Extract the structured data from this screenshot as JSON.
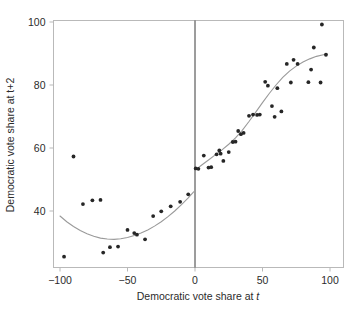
{
  "chart_data": {
    "type": "scatter",
    "title": "",
    "xlabel": "Democratic vote share at t",
    "xlabel_plain": "Democratic vote share at ",
    "xlabel_italic": "t",
    "ylabel": "Democratic vote share at t+2",
    "xlim": [
      -110,
      110
    ],
    "ylim": [
      22,
      103
    ],
    "xticks": [
      -100,
      -50,
      0,
      50,
      100
    ],
    "xtick_labels": [
      "-100",
      "-50",
      "0",
      "50",
      "100"
    ],
    "yticks": [
      40,
      60,
      80,
      100
    ],
    "ytick_labels": [
      "40",
      "60",
      "80",
      "100"
    ],
    "grid": false,
    "legend": "none",
    "cutoff": 0,
    "point_color": "#262626",
    "curve_color": "#9a9a9a",
    "axis_color": "#b9b9b9",
    "cutoff_color": "#3a3a3a",
    "series": [
      {
        "name": "Districts left of cutoff",
        "points": [
          [
            -97,
            25.5
          ],
          [
            -90,
            57.3
          ],
          [
            -83,
            42.2
          ],
          [
            -76,
            43.4
          ],
          [
            -70,
            43.5
          ],
          [
            -68,
            26.8
          ],
          [
            -63,
            28.5
          ],
          [
            -57,
            28.7
          ],
          [
            -50,
            34.0
          ],
          [
            -45,
            33.0
          ],
          [
            -43,
            32.5
          ],
          [
            -37,
            31.0
          ],
          [
            -31,
            38.4
          ],
          [
            -25,
            39.9
          ],
          [
            -18,
            41.5
          ],
          [
            -11,
            42.9
          ],
          [
            -5,
            45.3
          ]
        ]
      },
      {
        "name": "Districts right of cutoff",
        "points": [
          [
            0.5,
            53.5
          ],
          [
            2.5,
            53.4
          ],
          [
            6.5,
            57.6
          ],
          [
            10,
            53.8
          ],
          [
            12,
            53.9
          ],
          [
            16,
            58.0
          ],
          [
            18,
            59.2
          ],
          [
            19,
            58.2
          ],
          [
            21,
            55.9
          ],
          [
            25,
            58.7
          ],
          [
            28,
            61.9
          ],
          [
            30,
            62.0
          ],
          [
            32,
            65.4
          ],
          [
            34,
            64.4
          ],
          [
            36,
            64.8
          ],
          [
            40,
            70.2
          ],
          [
            43,
            70.6
          ],
          [
            46,
            70.5
          ],
          [
            48,
            70.6
          ],
          [
            52,
            81.0
          ],
          [
            54,
            79.8
          ],
          [
            57,
            73.3
          ],
          [
            59,
            69.9
          ],
          [
            61,
            79.0
          ],
          [
            64,
            71.6
          ],
          [
            68,
            86.7
          ],
          [
            71,
            80.8
          ],
          [
            73,
            88.0
          ],
          [
            76,
            86.7
          ],
          [
            84,
            80.9
          ],
          [
            86,
            84.9
          ],
          [
            88,
            91.9
          ],
          [
            93,
            80.8
          ],
          [
            94,
            99.2
          ],
          [
            97,
            89.6
          ]
        ]
      }
    ],
    "fit_left": {
      "name": "Polynomial fit left of cutoff",
      "points": [
        [
          -100,
          38.4
        ],
        [
          -95,
          36.6
        ],
        [
          -90,
          35.1
        ],
        [
          -85,
          33.8
        ],
        [
          -80,
          32.8
        ],
        [
          -75,
          32.0
        ],
        [
          -70,
          31.4
        ],
        [
          -65,
          31.1
        ],
        [
          -60,
          31.0
        ],
        [
          -55,
          31.2
        ],
        [
          -50,
          31.6
        ],
        [
          -45,
          32.2
        ],
        [
          -40,
          33.0
        ],
        [
          -35,
          34.0
        ],
        [
          -30,
          35.2
        ],
        [
          -25,
          36.6
        ],
        [
          -20,
          38.2
        ],
        [
          -15,
          40.0
        ],
        [
          -10,
          42.0
        ],
        [
          -5,
          44.2
        ],
        [
          -1,
          46.1
        ]
      ]
    },
    "fit_right": {
      "name": "Polynomial fit right of cutoff",
      "points": [
        [
          1,
          53.3
        ],
        [
          5,
          54.6
        ],
        [
          10,
          56.2
        ],
        [
          15,
          57.8
        ],
        [
          20,
          59.4
        ],
        [
          25,
          61.2
        ],
        [
          30,
          63.2
        ],
        [
          35,
          65.6
        ],
        [
          40,
          68.4
        ],
        [
          45,
          71.4
        ],
        [
          50,
          74.4
        ],
        [
          55,
          77.3
        ],
        [
          60,
          80.0
        ],
        [
          65,
          82.4
        ],
        [
          70,
          84.4
        ],
        [
          75,
          86.0
        ],
        [
          80,
          87.3
        ],
        [
          85,
          88.3
        ],
        [
          90,
          89.1
        ],
        [
          95,
          89.6
        ],
        [
          98,
          89.8
        ]
      ]
    }
  }
}
